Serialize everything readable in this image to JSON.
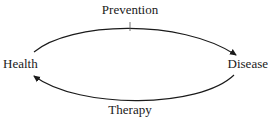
{
  "diagram": {
    "type": "cycle",
    "nodes": [
      {
        "id": "health",
        "label": "Health"
      },
      {
        "id": "disease",
        "label": "Disease"
      }
    ],
    "edges": [
      {
        "from": "health",
        "to": "disease",
        "label": "Prevention",
        "position": "top",
        "marker": "tick-mark"
      },
      {
        "from": "disease",
        "to": "health",
        "label": "Therapy",
        "position": "bottom"
      }
    ],
    "colors": {
      "line": "#1a1a1a",
      "text": "#1a1a1a",
      "background": "#ffffff"
    }
  }
}
